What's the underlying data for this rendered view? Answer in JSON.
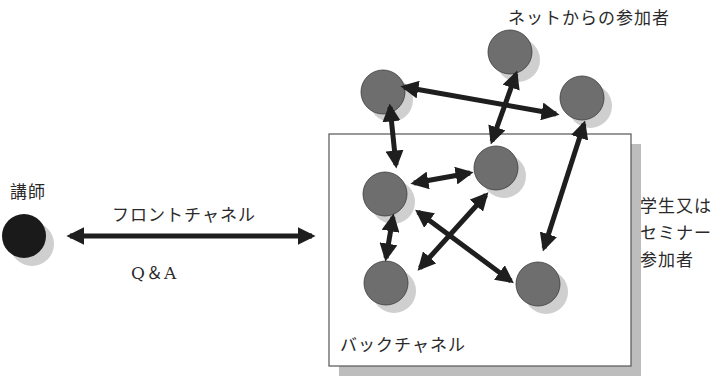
{
  "labels": {
    "lecturer": "講師",
    "front_channel": "フロントチャネル",
    "qa": "Q＆A",
    "net_participants": "ネットからの参加者",
    "students": "学生又は\nセミナー\n参加者",
    "back_channel": "バックチャネル"
  },
  "colors": {
    "lecturer_node": "#1a1a1a",
    "participant_node": "#6e6e6e",
    "node_shadow": "#cfcfcf",
    "arrow": "#1e1e1e",
    "box_border": "#555555",
    "box_shadow": "#bdbdbd"
  },
  "nodes": [
    {
      "id": "lecturer",
      "group": "lecturer",
      "cx": 24,
      "cy": 236
    },
    {
      "id": "net-1",
      "group": "net",
      "cx": 383,
      "cy": 92
    },
    {
      "id": "net-2",
      "group": "net",
      "cx": 510,
      "cy": 52
    },
    {
      "id": "net-3",
      "group": "net",
      "cx": 582,
      "cy": 98
    },
    {
      "id": "room-1",
      "group": "room",
      "cx": 385,
      "cy": 194
    },
    {
      "id": "room-2",
      "group": "room",
      "cx": 496,
      "cy": 168
    },
    {
      "id": "room-3",
      "group": "room",
      "cx": 386,
      "cy": 283
    },
    {
      "id": "room-4",
      "group": "room",
      "cx": 538,
      "cy": 284
    }
  ],
  "edges": [
    {
      "from": "lecturer",
      "to": "backchannel-box",
      "label": "フロントチャネル / Q＆A",
      "bidirectional": true
    },
    {
      "from": "net-1",
      "to": "net-3",
      "bidirectional": true
    },
    {
      "from": "net-1",
      "to": "room-1",
      "bidirectional": true
    },
    {
      "from": "net-2",
      "to": "room-2",
      "bidirectional": true
    },
    {
      "from": "net-3",
      "to": "room-4",
      "bidirectional": true
    },
    {
      "from": "room-1",
      "to": "room-2",
      "bidirectional": true
    },
    {
      "from": "room-1",
      "to": "room-3",
      "bidirectional": true
    },
    {
      "from": "room-1",
      "to": "room-4",
      "bidirectional": true
    },
    {
      "from": "room-2",
      "to": "room-3",
      "bidirectional": true
    }
  ]
}
